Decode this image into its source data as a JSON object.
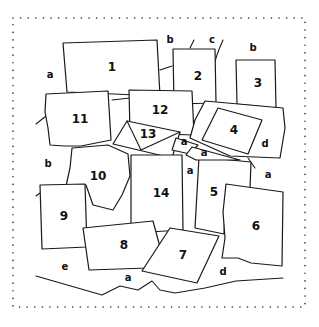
{
  "pieces": [
    {
      "id": "1",
      "label": "1"
    },
    {
      "id": "2",
      "label": "2"
    },
    {
      "id": "3",
      "label": "3"
    },
    {
      "id": "4",
      "label": "4"
    },
    {
      "id": "5",
      "label": "5"
    },
    {
      "id": "6",
      "label": "6"
    },
    {
      "id": "7",
      "label": "7"
    },
    {
      "id": "8",
      "label": "8"
    },
    {
      "id": "9",
      "label": "9"
    },
    {
      "id": "10",
      "label": "10"
    },
    {
      "id": "11",
      "label": "11"
    },
    {
      "id": "12",
      "label": "12"
    },
    {
      "id": "13",
      "label": "13"
    },
    {
      "id": "14",
      "label": "14"
    }
  ],
  "regions": [
    {
      "label": "a"
    },
    {
      "label": "b"
    },
    {
      "label": "c"
    },
    {
      "label": "b"
    },
    {
      "label": "b"
    },
    {
      "label": "d"
    },
    {
      "label": "a"
    },
    {
      "label": "a"
    },
    {
      "label": "a"
    },
    {
      "label": "a"
    },
    {
      "label": "e"
    },
    {
      "label": "a"
    },
    {
      "label": "d"
    }
  ]
}
